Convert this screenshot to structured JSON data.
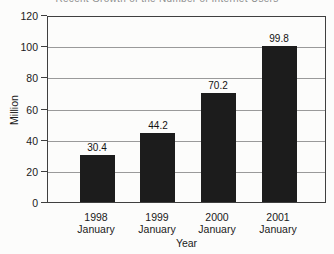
{
  "chart_data": {
    "type": "bar",
    "title": "Recent Growth of the Number of Internet Users",
    "title_clipped": true,
    "categories": [
      "1998\nJanuary",
      "1999\nJanuary",
      "2000\nJanuary",
      "2001\nJanuary"
    ],
    "values": [
      30.4,
      44.2,
      70.2,
      99.8
    ],
    "value_labels": [
      "30.4",
      "44.2",
      "70.2",
      "99.8"
    ],
    "xlabel": "Year",
    "ylabel": "Million",
    "ylim": [
      0,
      120
    ],
    "yticks": [
      0,
      20,
      40,
      60,
      80,
      100,
      120
    ],
    "grid": true,
    "legend": "none",
    "bar_color": "#1c1c1c",
    "gridline_color": "#9a9a9a",
    "border_color": "#3f3f3f",
    "background_color": "#fcfcfb",
    "text_color": "#1a1a1a"
  }
}
